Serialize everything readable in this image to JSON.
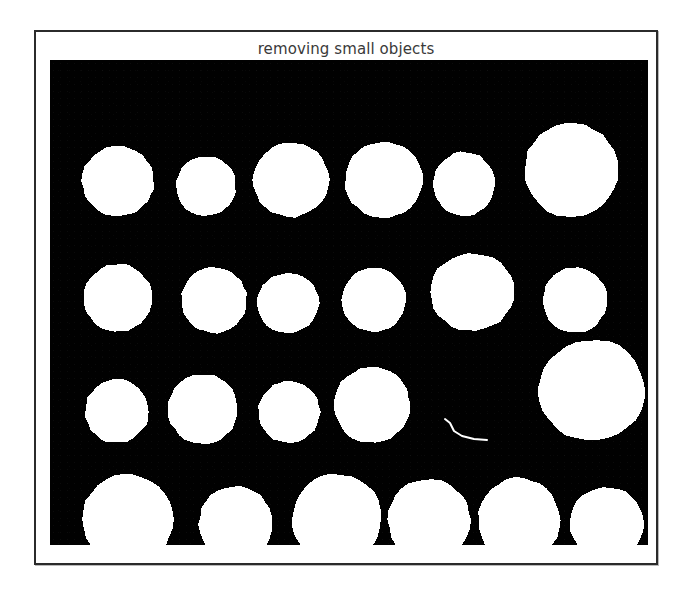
{
  "figure": {
    "title": "removing small objects",
    "title_color": "#3a3a3a",
    "frame_border_color": "#2b2b2b",
    "page_background": "#ffffff"
  },
  "image": {
    "type": "binary-mask",
    "background_color": "#010101",
    "foreground_color": "#ffffff",
    "width_px": 598,
    "height_px": 485,
    "description": "binary segmentation mask of round blobs (coins/cells) on black background after small-object removal",
    "blob_count": 23,
    "artifact_count": 1,
    "blobs": [
      {
        "row": 1,
        "index": 1,
        "cx": 68,
        "cy": 121,
        "rx": 36,
        "ry": 35
      },
      {
        "row": 1,
        "index": 2,
        "cx": 156,
        "cy": 126,
        "rx": 30,
        "ry": 30
      },
      {
        "row": 1,
        "index": 3,
        "cx": 241,
        "cy": 120,
        "rx": 38,
        "ry": 37
      },
      {
        "row": 1,
        "index": 4,
        "cx": 334,
        "cy": 120,
        "rx": 39,
        "ry": 38
      },
      {
        "row": 1,
        "index": 5,
        "cx": 414,
        "cy": 124,
        "rx": 31,
        "ry": 32
      },
      {
        "row": 1,
        "index": 6,
        "cx": 521,
        "cy": 110,
        "rx": 47,
        "ry": 47
      },
      {
        "row": 2,
        "index": 1,
        "cx": 68,
        "cy": 238,
        "rx": 34,
        "ry": 34
      },
      {
        "row": 2,
        "index": 2,
        "cx": 164,
        "cy": 240,
        "rx": 33,
        "ry": 33
      },
      {
        "row": 2,
        "index": 3,
        "cx": 238,
        "cy": 243,
        "rx": 31,
        "ry": 30
      },
      {
        "row": 2,
        "index": 4,
        "cx": 324,
        "cy": 240,
        "rx": 32,
        "ry": 32
      },
      {
        "row": 2,
        "index": 5,
        "cx": 422,
        "cy": 232,
        "rx": 42,
        "ry": 39
      },
      {
        "row": 2,
        "index": 6,
        "cx": 525,
        "cy": 240,
        "rx": 32,
        "ry": 33
      },
      {
        "row": 3,
        "index": 1,
        "cx": 67,
        "cy": 351,
        "rx": 32,
        "ry": 32
      },
      {
        "row": 3,
        "index": 2,
        "cx": 153,
        "cy": 349,
        "rx": 35,
        "ry": 35
      },
      {
        "row": 3,
        "index": 3,
        "cx": 239,
        "cy": 352,
        "rx": 31,
        "ry": 31
      },
      {
        "row": 3,
        "index": 4,
        "cx": 322,
        "cy": 345,
        "rx": 38,
        "ry": 38
      },
      {
        "row": 3,
        "index": 5,
        "cx": 542,
        "cy": 330,
        "rx": 53,
        "ry": 51
      },
      {
        "row": 4,
        "index": 1,
        "cx": 78,
        "cy": 459,
        "rx": 46,
        "ry": 45
      },
      {
        "row": 4,
        "index": 2,
        "cx": 186,
        "cy": 464,
        "rx": 37,
        "ry": 38
      },
      {
        "row": 4,
        "index": 3,
        "cx": 287,
        "cy": 458,
        "rx": 45,
        "ry": 44
      },
      {
        "row": 4,
        "index": 4,
        "cx": 379,
        "cy": 460,
        "rx": 41,
        "ry": 41
      },
      {
        "row": 4,
        "index": 5,
        "cx": 469,
        "cy": 460,
        "rx": 41,
        "ry": 42
      },
      {
        "row": 4,
        "index": 6,
        "cx": 557,
        "cy": 464,
        "rx": 37,
        "ry": 37
      }
    ],
    "artifacts": [
      {
        "name": "thin-filament",
        "kind": "polyline",
        "stroke_width": 2,
        "points": "395,359 400,363 404,371 412,376 424,379 437,380"
      }
    ]
  }
}
